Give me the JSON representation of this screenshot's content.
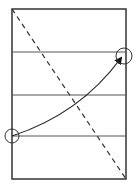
{
  "diagram": {
    "width": 138,
    "height": 188,
    "frame": {
      "x": 12,
      "y": 9,
      "width": 114,
      "height": 170,
      "stroke": "#333333"
    },
    "horizontal_lines": [
      {
        "y": 52,
        "stroke": "#555555"
      },
      {
        "y": 95,
        "stroke": "#555555"
      },
      {
        "y": 136,
        "stroke": "#555555"
      }
    ],
    "dashed_diagonal": {
      "x1": 12,
      "y1": 9,
      "x2": 126,
      "y2": 179,
      "stroke": "#333333",
      "dash": "5,4"
    },
    "start_marker": {
      "cx": 12,
      "cy": 136,
      "r": 7,
      "stroke": "#333333"
    },
    "end_marker": {
      "cx": 124,
      "cy": 56,
      "r": 8,
      "stroke": "#333333"
    },
    "arrow_curve": {
      "path": "M 12 136 Q 80 114 121 58",
      "stroke": "#222222",
      "arrowhead_color": "#111111"
    }
  }
}
